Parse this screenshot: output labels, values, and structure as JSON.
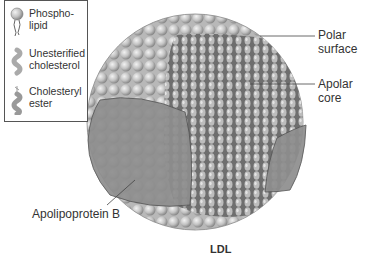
{
  "legend": {
    "items": [
      {
        "icon": "phospholipid-icon",
        "label_lines": [
          "Phospho-",
          "lipid"
        ]
      },
      {
        "icon": "unesterified-cholesterol-icon",
        "label_lines": [
          "Unesterified",
          "cholesterol"
        ]
      },
      {
        "icon": "cholesteryl-ester-icon",
        "label_lines": [
          "Cholesteryl",
          "ester"
        ]
      }
    ]
  },
  "labels": {
    "polar_surface": [
      "Polar",
      "surface"
    ],
    "apolar_core": [
      "Apolar",
      "core"
    ],
    "apolipoprotein": "Apolipoprotein B"
  },
  "title": "LDL",
  "colors": {
    "sphere_shell": "#c8c8c8",
    "core": "#9a9a9a",
    "protein": "#8e8e8e",
    "outline": "#555555"
  }
}
